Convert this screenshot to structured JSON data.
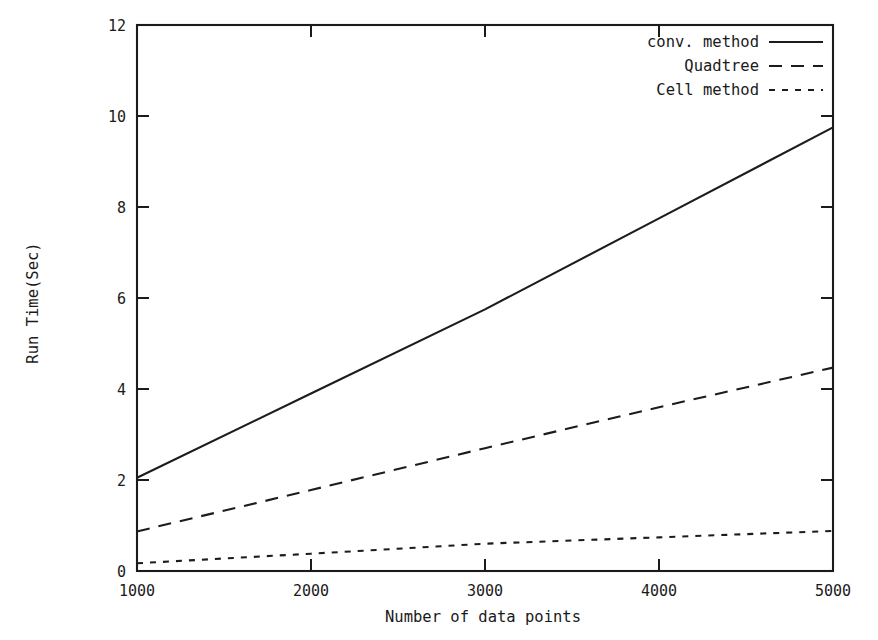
{
  "chart_data": {
    "type": "line",
    "title": "",
    "xlabel": "Number of data points",
    "ylabel": "Run Time(Sec)",
    "xlim": [
      1000,
      5000
    ],
    "ylim": [
      0,
      12
    ],
    "xticks": [
      1000,
      2000,
      3000,
      4000,
      5000
    ],
    "xtick_labels": [
      "1000",
      "2000",
      "3000",
      "4000",
      "5000"
    ],
    "yticks": [
      0,
      2,
      4,
      6,
      8,
      10,
      12
    ],
    "ytick_labels": [
      "0",
      "2",
      "4",
      "6",
      "8",
      "10",
      "12"
    ],
    "grid": false,
    "legend_position": "top-right inside axes",
    "x": [
      1000,
      2000,
      3000,
      4000,
      5000
    ],
    "series": [
      {
        "name": "conv. method",
        "style": "solid",
        "values": [
          2.05,
          3.9,
          5.75,
          7.75,
          9.75
        ]
      },
      {
        "name": "Quadtree",
        "style": "dashed",
        "values": [
          0.87,
          1.78,
          2.7,
          3.6,
          4.47
        ]
      },
      {
        "name": "Cell method",
        "style": "dotted",
        "values": [
          0.17,
          0.38,
          0.6,
          0.74,
          0.88
        ]
      }
    ]
  },
  "legend": {
    "entries": [
      {
        "label": "conv. method",
        "style": "solid"
      },
      {
        "label": "Quadtree",
        "style": "dashed"
      },
      {
        "label": "Cell method",
        "style": "dotted"
      }
    ]
  },
  "colors": {
    "ink": "#1c1c1c",
    "background": "#ffffff"
  }
}
